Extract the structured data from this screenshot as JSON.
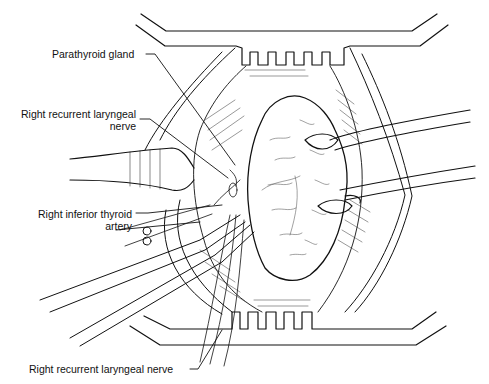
{
  "figure": {
    "colors": {
      "ink": "#111111",
      "background": "#ffffff"
    }
  },
  "labels": {
    "parathyroid_gland": "Parathyroid gland",
    "right_recurrent_laryngeal_nerve_top_line1": "Right recurrent laryngeal",
    "right_recurrent_laryngeal_nerve_top_line2": "nerve",
    "right_inferior_thyroid_artery_line1": "Right inferior thyroid",
    "right_inferior_thyroid_artery_line2": "artery",
    "right_recurrent_laryngeal_nerve_bottom": "Right recurrent laryngeal nerve"
  }
}
